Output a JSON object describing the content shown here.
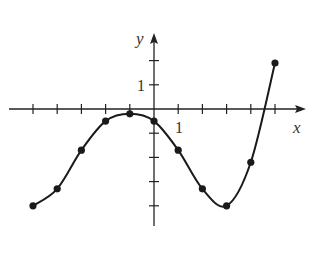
{
  "chart_data": {
    "type": "line",
    "title": "",
    "xlabel": "x",
    "ylabel": "y",
    "x": [
      -5,
      -4,
      -3,
      -2,
      -1,
      0,
      1,
      2,
      3,
      4,
      5
    ],
    "series": [
      {
        "name": "f(x)",
        "values": [
          -4.0,
          -3.3,
          -1.7,
          -0.5,
          -0.2,
          -0.5,
          -1.7,
          -3.3,
          -4.0,
          -2.2,
          1.9
        ],
        "markers": true,
        "smooth": true
      }
    ],
    "xlim": [
      -5.9,
      6.2
    ],
    "ylim": [
      -4.8,
      3.0
    ],
    "x_ticks": [
      -5,
      -4,
      -3,
      -2,
      -1,
      1,
      2,
      3,
      4,
      5
    ],
    "y_ticks": [
      -4,
      -3,
      -2,
      -1,
      1,
      2
    ],
    "tick_labels": {
      "x": "1",
      "y": "1"
    },
    "grid": false,
    "legend": "none"
  },
  "labels": {
    "x_axis": "x",
    "y_axis": "y",
    "x_unit": "1",
    "y_unit": "1"
  },
  "colors": {
    "curve": "#1a1a1a",
    "axis": "#222222",
    "background": "#ffffff"
  }
}
